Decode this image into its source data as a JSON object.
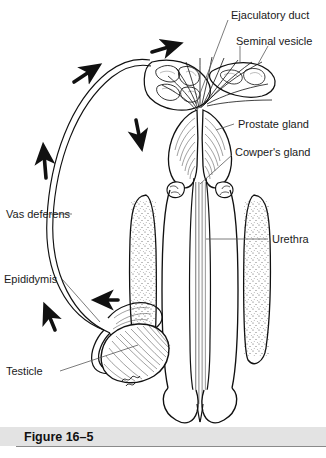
{
  "figure": {
    "caption": "Figure 16–5",
    "caption_bar_color": "#e3e3e3",
    "ink_color": "#111111",
    "background": "#ffffff"
  },
  "labels": [
    {
      "id": "ejaculatory-duct",
      "text": "Ejaculatory duct",
      "x": 231,
      "y": 15
    },
    {
      "id": "seminal-vesicle",
      "text": "Seminal vesicle",
      "x": 236,
      "y": 41
    },
    {
      "id": "prostate-gland",
      "text": "Prostate gland",
      "x": 238,
      "y": 124
    },
    {
      "id": "cowpers-gland",
      "text": "Cowper's gland",
      "x": 235,
      "y": 152
    },
    {
      "id": "urethra",
      "text": "Urethra",
      "x": 272,
      "y": 239
    },
    {
      "id": "vas-deferens",
      "text": "Vas deferens",
      "x": 6,
      "y": 214
    },
    {
      "id": "epididymis",
      "text": "Epididymis",
      "x": 4,
      "y": 279
    },
    {
      "id": "testicle",
      "text": "Testicle",
      "x": 6,
      "y": 371
    }
  ],
  "flow_arrows": [
    {
      "id": "arrow-epididymis-to-vas",
      "direction": "up-left",
      "meaning": "sperm leaving epididymis"
    },
    {
      "id": "arrow-testicle-to-epididymis",
      "direction": "left",
      "meaning": "sperm entering epididymis"
    },
    {
      "id": "arrow-vas-ascending",
      "direction": "up",
      "meaning": "sperm ascending vas deferens"
    },
    {
      "id": "arrow-vas-arch",
      "direction": "up-right",
      "meaning": "sperm over the arch"
    },
    {
      "id": "arrow-to-seminal-vesicle",
      "direction": "right",
      "meaning": "toward seminal vesicle"
    },
    {
      "id": "arrow-to-prostate",
      "direction": "down",
      "meaning": "down toward prostate"
    }
  ]
}
